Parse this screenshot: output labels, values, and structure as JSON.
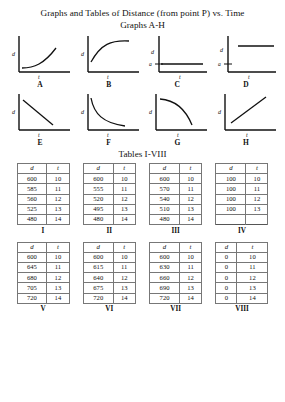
{
  "document": {
    "main_title": "Graphs and Tables of Distance (from point P) vs. Time",
    "graphs_heading": "Graphs A-H",
    "tables_heading": "Tables I-VIII"
  },
  "graphs": {
    "axis_y_label": "d",
    "axis_x_label": "t",
    "tick_label": "a",
    "items": [
      {
        "letter": "A",
        "shape": "increasing-convex-curve",
        "has_tick": false
      },
      {
        "letter": "B",
        "shape": "increasing-concave-curve",
        "has_tick": false
      },
      {
        "letter": "C",
        "shape": "horizontal-line-low",
        "has_tick": true
      },
      {
        "letter": "D",
        "shape": "horizontal-line-high",
        "has_tick": true
      },
      {
        "letter": "E",
        "shape": "decreasing-straight-line",
        "has_tick": false
      },
      {
        "letter": "F",
        "shape": "decreasing-convex-curve",
        "has_tick": false
      },
      {
        "letter": "G",
        "shape": "decreasing-concave-curve",
        "has_tick": false
      },
      {
        "letter": "H",
        "shape": "increasing-straight-line",
        "has_tick": false
      }
    ]
  },
  "tables": {
    "columns": [
      "d",
      "t"
    ],
    "items": [
      {
        "roman": "I",
        "rows": [
          [
            "600",
            "10"
          ],
          [
            "585",
            "11"
          ],
          [
            "560",
            "12"
          ],
          [
            "525",
            "13"
          ],
          [
            "480",
            "14"
          ]
        ],
        "filler_rows": 0
      },
      {
        "roman": "II",
        "rows": [
          [
            "600",
            "10"
          ],
          [
            "555",
            "11"
          ],
          [
            "520",
            "12"
          ],
          [
            "495",
            "13"
          ],
          [
            "480",
            "14"
          ]
        ],
        "filler_rows": 0
      },
      {
        "roman": "III",
        "rows": [
          [
            "600",
            "10"
          ],
          [
            "570",
            "11"
          ],
          [
            "540",
            "12"
          ],
          [
            "510",
            "13"
          ],
          [
            "480",
            "14"
          ]
        ],
        "filler_rows": 0
      },
      {
        "roman": "IV",
        "rows": [
          [
            "100",
            "10"
          ],
          [
            "100",
            "11"
          ],
          [
            "100",
            "12"
          ],
          [
            "100",
            "13"
          ]
        ],
        "filler_rows": 1
      },
      {
        "roman": "V",
        "rows": [
          [
            "600",
            "10"
          ],
          [
            "645",
            "11"
          ],
          [
            "680",
            "12"
          ],
          [
            "705",
            "13"
          ],
          [
            "720",
            "14"
          ]
        ],
        "filler_rows": 0
      },
      {
        "roman": "VI",
        "rows": [
          [
            "600",
            "10"
          ],
          [
            "615",
            "11"
          ],
          [
            "640",
            "12"
          ],
          [
            "675",
            "13"
          ],
          [
            "720",
            "14"
          ]
        ],
        "filler_rows": 0
      },
      {
        "roman": "VII",
        "rows": [
          [
            "600",
            "10"
          ],
          [
            "630",
            "11"
          ],
          [
            "660",
            "12"
          ],
          [
            "690",
            "13"
          ],
          [
            "720",
            "14"
          ]
        ],
        "filler_rows": 0
      },
      {
        "roman": "VIII",
        "rows": [
          [
            "0",
            "10"
          ],
          [
            "0",
            "11"
          ],
          [
            "0",
            "12"
          ],
          [
            "0",
            "13"
          ],
          [
            "0",
            "14"
          ]
        ],
        "filler_rows": 0
      }
    ]
  },
  "colors": {
    "ink": "#111111",
    "rule": "#777777",
    "page": "#ffffff"
  }
}
